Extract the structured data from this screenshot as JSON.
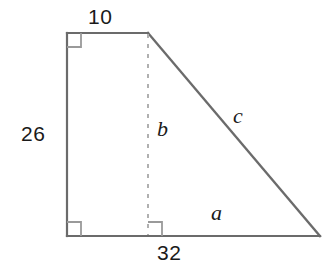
{
  "figure": {
    "colors": {
      "stroke": "#6b6b6b",
      "dashed_stroke": "#b0b0b0",
      "right_angle_stroke": "#9a9a9a",
      "text": "#1a1a1a",
      "background": "#ffffff"
    },
    "geometry": {
      "top_left": [
        67,
        33
      ],
      "top_right": [
        148,
        33
      ],
      "bottom_left": [
        67,
        236
      ],
      "bottom_right": [
        320,
        236
      ],
      "altitude_foot": [
        148,
        236
      ]
    },
    "labels": {
      "top_side": "10",
      "left_side": "26",
      "bottom_side": "32",
      "base_segment": "a",
      "altitude": "b",
      "hypotenuse": "c"
    }
  }
}
